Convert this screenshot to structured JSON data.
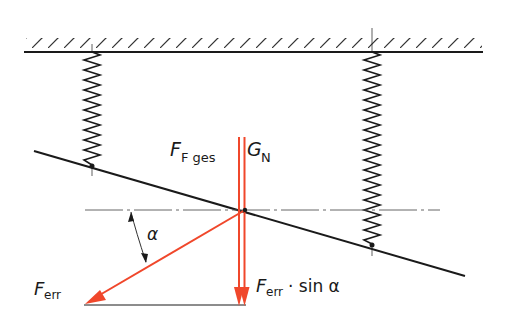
{
  "figure": {
    "colors": {
      "line": "#1a1a1a",
      "force": "#f0472b",
      "hatch": "#333333",
      "background": "#ffffff"
    }
  },
  "labels": {
    "ffges_main": "F",
    "ffges_sub": "F ges",
    "gn_main": "G",
    "gn_sub": "N",
    "alpha": "α",
    "ferr_main": "F",
    "ferr_sub": "err",
    "ferr_sin_main": "F",
    "ferr_sin_sub": "err",
    "ferr_sin_rest": "· sin α"
  }
}
